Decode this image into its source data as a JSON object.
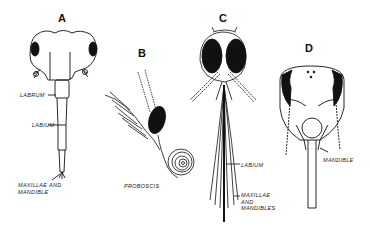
{
  "figure": {
    "panels": [
      {
        "id": "A",
        "letter": "A",
        "labels": [
          "LABRUM",
          "LABIUM",
          "MAXILLAE AND\nMANDIBLE"
        ]
      },
      {
        "id": "B",
        "letter": "B",
        "labels": [
          "PROBOSCIS"
        ]
      },
      {
        "id": "C",
        "letter": "C",
        "labels": [
          "LABIUM",
          "MAXILLAE\nAND\nMANDIBLES"
        ]
      },
      {
        "id": "D",
        "letter": "D",
        "labels": [
          "MANDIBLE"
        ]
      }
    ]
  },
  "colors": {
    "ink": "#111111",
    "paper": "#ffffff"
  }
}
